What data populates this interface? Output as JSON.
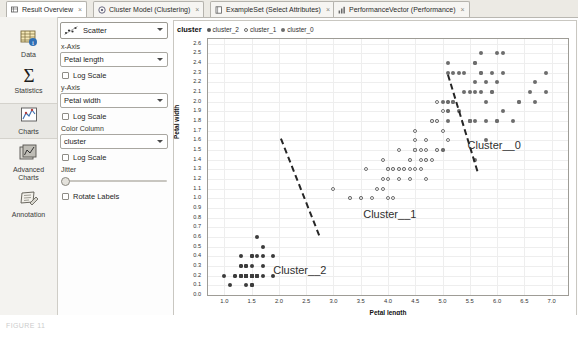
{
  "tabs": [
    {
      "label": "Result Overview",
      "icon": "result-overview-icon",
      "active": true,
      "close": "×"
    },
    {
      "label": "Cluster Model (Clustering)",
      "icon": "cluster-model-icon",
      "active": false,
      "close": "×"
    },
    {
      "label": "ExampleSet (Select Attributes)",
      "icon": "exampleset-icon",
      "active": false,
      "close": "×"
    },
    {
      "label": "PerformanceVector (Performance)",
      "icon": "performance-icon",
      "active": false,
      "close": "×"
    }
  ],
  "sidebar": {
    "items": [
      {
        "label": "Data",
        "icon": "data-table-icon",
        "selected": false
      },
      {
        "label": "Statistics",
        "icon": "sigma-icon",
        "selected": false
      },
      {
        "label": "Charts",
        "icon": "charts-icon",
        "selected": true
      },
      {
        "label": "Advanced\nCharts",
        "line1": "Advanced",
        "line2": "Charts",
        "icon": "advanced-charts-icon",
        "selected": false
      },
      {
        "label": "Annotation",
        "icon": "annotation-icon",
        "selected": false
      }
    ]
  },
  "controls": {
    "chart_type": {
      "label": "Scatter",
      "icon": "scatter-icon"
    },
    "x_axis": {
      "label": "x-Axis",
      "value": "Petal length"
    },
    "x_log": {
      "label": "Log Scale",
      "checked": false
    },
    "y_axis": {
      "label": "y-Axis",
      "value": "Petal width"
    },
    "y_log": {
      "label": "Log Scale",
      "checked": false
    },
    "color_column": {
      "label": "Color Column",
      "value": "cluster"
    },
    "color_log": {
      "label": "Log Scale",
      "checked": false
    },
    "jitter": {
      "label": "Jitter",
      "value": 0
    },
    "rotate_labels": {
      "label": "Rotate Labels",
      "checked": false
    }
  },
  "legend": {
    "title": "cluster",
    "items": [
      {
        "label": "cluster_2",
        "marker": "fill",
        "color": "#3c3c3c"
      },
      {
        "label": "cluster_1",
        "marker": "hollow",
        "color": "#ffffff"
      },
      {
        "label": "cluster_0",
        "marker": "fill",
        "color": "#6d6d6d"
      }
    ]
  },
  "annotations": [
    {
      "text": "Cluster__0",
      "x": 0.795,
      "y": 0.445
    },
    {
      "text": "Cluster__1",
      "x": 0.505,
      "y": 0.715
    },
    {
      "text": "Cluster__2",
      "x": 0.255,
      "y": 0.935
    }
  ],
  "caption": "FIGURE 11",
  "chart_data": {
    "type": "scatter",
    "title": "",
    "xlabel": "Petal length",
    "ylabel": "Petal width",
    "xlim": [
      0.7,
      7.3
    ],
    "ylim": [
      0.0,
      2.65
    ],
    "xticks": [
      1.0,
      1.5,
      2.0,
      2.5,
      3.0,
      3.5,
      4.0,
      4.5,
      5.0,
      5.5,
      6.0,
      6.5,
      7.0
    ],
    "yticks": [
      0.0,
      0.1,
      0.2,
      0.3,
      0.4,
      0.5,
      0.6,
      0.7,
      0.8,
      0.9,
      1.0,
      1.1,
      1.2,
      1.3,
      1.4,
      1.5,
      1.6,
      1.7,
      1.8,
      1.9,
      2.0,
      2.1,
      2.2,
      2.3,
      2.4,
      2.5,
      2.6
    ],
    "grid": true,
    "legend_position": "top-left",
    "series": [
      {
        "name": "cluster_2",
        "marker": "filled-circle",
        "color": "#3c3c3c",
        "points": [
          [
            1.4,
            0.2
          ],
          [
            1.4,
            0.2
          ],
          [
            1.3,
            0.2
          ],
          [
            1.5,
            0.2
          ],
          [
            1.4,
            0.2
          ],
          [
            1.7,
            0.4
          ],
          [
            1.4,
            0.3
          ],
          [
            1.5,
            0.2
          ],
          [
            1.4,
            0.2
          ],
          [
            1.5,
            0.1
          ],
          [
            1.5,
            0.2
          ],
          [
            1.6,
            0.2
          ],
          [
            1.4,
            0.1
          ],
          [
            1.1,
            0.1
          ],
          [
            1.2,
            0.2
          ],
          [
            1.5,
            0.4
          ],
          [
            1.3,
            0.4
          ],
          [
            1.4,
            0.3
          ],
          [
            1.7,
            0.3
          ],
          [
            1.5,
            0.3
          ],
          [
            1.7,
            0.2
          ],
          [
            1.5,
            0.4
          ],
          [
            1.0,
            0.2
          ],
          [
            1.7,
            0.5
          ],
          [
            1.9,
            0.2
          ],
          [
            1.6,
            0.2
          ],
          [
            1.6,
            0.4
          ],
          [
            1.5,
            0.2
          ],
          [
            1.4,
            0.2
          ],
          [
            1.6,
            0.2
          ],
          [
            1.6,
            0.2
          ],
          [
            1.5,
            0.4
          ],
          [
            1.5,
            0.1
          ],
          [
            1.4,
            0.2
          ],
          [
            1.5,
            0.2
          ],
          [
            1.2,
            0.2
          ],
          [
            1.3,
            0.2
          ],
          [
            1.5,
            0.1
          ],
          [
            1.3,
            0.2
          ],
          [
            1.5,
            0.2
          ],
          [
            1.3,
            0.3
          ],
          [
            1.3,
            0.3
          ],
          [
            1.3,
            0.2
          ],
          [
            1.6,
            0.6
          ],
          [
            1.9,
            0.4
          ],
          [
            1.4,
            0.3
          ],
          [
            1.6,
            0.2
          ],
          [
            1.4,
            0.2
          ],
          [
            1.5,
            0.2
          ],
          [
            1.4,
            0.2
          ]
        ]
      },
      {
        "name": "cluster_1",
        "marker": "hollow-circle",
        "color": "#ffffff",
        "points": [
          [
            4.7,
            1.4
          ],
          [
            4.5,
            1.5
          ],
          [
            4.9,
            1.5
          ],
          [
            4.0,
            1.3
          ],
          [
            4.6,
            1.5
          ],
          [
            4.5,
            1.3
          ],
          [
            4.7,
            1.6
          ],
          [
            3.3,
            1.0
          ],
          [
            4.6,
            1.3
          ],
          [
            3.9,
            1.4
          ],
          [
            3.5,
            1.0
          ],
          [
            4.2,
            1.5
          ],
          [
            4.0,
            1.0
          ],
          [
            4.7,
            1.4
          ],
          [
            3.6,
            1.3
          ],
          [
            4.4,
            1.4
          ],
          [
            4.5,
            1.5
          ],
          [
            4.1,
            1.0
          ],
          [
            4.5,
            1.5
          ],
          [
            3.9,
            1.1
          ],
          [
            4.8,
            1.8
          ],
          [
            4.0,
            1.3
          ],
          [
            4.9,
            1.5
          ],
          [
            4.7,
            1.2
          ],
          [
            4.3,
            1.3
          ],
          [
            4.4,
            1.4
          ],
          [
            4.8,
            1.4
          ],
          [
            5.0,
            1.7
          ],
          [
            4.5,
            1.5
          ],
          [
            3.5,
            1.0
          ],
          [
            3.8,
            1.1
          ],
          [
            3.7,
            1.0
          ],
          [
            3.9,
            1.2
          ],
          [
            5.1,
            1.6
          ],
          [
            4.5,
            1.5
          ],
          [
            4.5,
            1.6
          ],
          [
            4.7,
            1.5
          ],
          [
            4.4,
            1.3
          ],
          [
            4.1,
            1.3
          ],
          [
            4.0,
            1.3
          ],
          [
            4.4,
            1.2
          ],
          [
            4.6,
            1.4
          ],
          [
            4.0,
            1.2
          ],
          [
            3.3,
            1.0
          ],
          [
            4.2,
            1.3
          ],
          [
            4.2,
            1.2
          ],
          [
            4.2,
            1.3
          ],
          [
            4.3,
            1.3
          ],
          [
            3.0,
            1.1
          ],
          [
            4.1,
            1.3
          ],
          [
            4.5,
            1.7
          ],
          [
            4.9,
            1.8
          ],
          [
            4.8,
            1.8
          ],
          [
            4.9,
            2.0
          ],
          [
            4.9,
            1.8
          ],
          [
            5.0,
            1.9
          ],
          [
            5.1,
            1.9
          ],
          [
            4.8,
            1.8
          ],
          [
            5.1,
            2.0
          ],
          [
            5.0,
            1.5
          ]
        ]
      },
      {
        "name": "cluster_0",
        "marker": "filled-circle",
        "color": "#6d6d6d",
        "points": [
          [
            6.0,
            2.5
          ],
          [
            5.1,
            1.9
          ],
          [
            5.9,
            2.1
          ],
          [
            5.6,
            1.8
          ],
          [
            5.8,
            2.2
          ],
          [
            6.6,
            2.1
          ],
          [
            5.7,
            2.5
          ],
          [
            5.8,
            2.0
          ],
          [
            6.0,
            1.8
          ],
          [
            5.6,
            2.1
          ],
          [
            6.1,
            2.5
          ],
          [
            5.1,
            2.0
          ],
          [
            5.3,
            1.9
          ],
          [
            5.5,
            2.1
          ],
          [
            5.0,
            2.0
          ],
          [
            5.1,
            2.4
          ],
          [
            5.3,
            2.3
          ],
          [
            5.5,
            1.8
          ],
          [
            6.7,
            2.2
          ],
          [
            6.9,
            2.3
          ],
          [
            5.7,
            2.1
          ],
          [
            5.8,
            1.6
          ],
          [
            6.4,
            2.0
          ],
          [
            5.6,
            1.4
          ],
          [
            6.1,
            2.3
          ],
          [
            5.6,
            2.4
          ],
          [
            5.5,
            1.8
          ],
          [
            5.5,
            1.8
          ],
          [
            6.7,
            2.0
          ],
          [
            6.9,
            2.1
          ],
          [
            5.7,
            2.3
          ],
          [
            5.2,
            2.3
          ],
          [
            5.0,
            1.5
          ],
          [
            5.2,
            2.0
          ],
          [
            5.4,
            2.3
          ],
          [
            5.1,
            1.8
          ],
          [
            6.3,
            1.8
          ],
          [
            5.8,
            1.8
          ],
          [
            6.1,
            1.9
          ],
          [
            6.4,
            2.0
          ],
          [
            5.6,
            2.2
          ],
          [
            5.9,
            2.3
          ],
          [
            5.7,
            2.3
          ],
          [
            5.2,
            2.0
          ],
          [
            6.0,
            1.8
          ],
          [
            5.4,
            2.1
          ],
          [
            5.6,
            2.4
          ],
          [
            5.1,
            2.3
          ],
          [
            5.9,
            2.1
          ],
          [
            6.0,
            2.2
          ]
        ]
      }
    ],
    "separators": [
      {
        "name": "cluster2-cluster1-boundary",
        "x1": 2.02,
        "y1": 1.62,
        "x2": 2.72,
        "y2": 0.62
      },
      {
        "name": "cluster1-cluster0-boundary",
        "x1": 5.08,
        "y1": 2.28,
        "x2": 5.62,
        "y2": 1.28
      }
    ]
  }
}
